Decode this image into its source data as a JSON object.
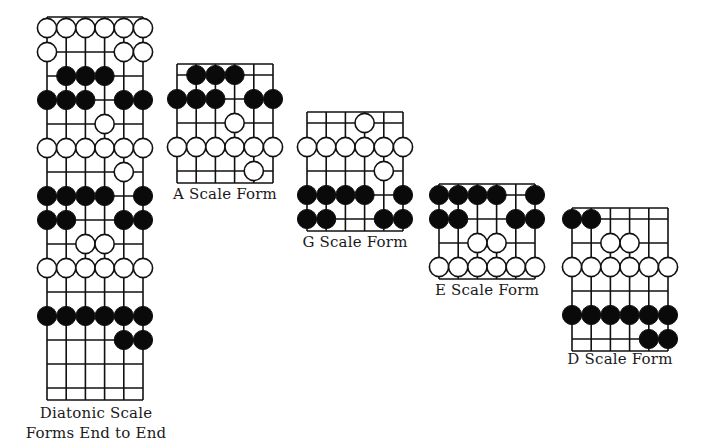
{
  "diagrams": [
    {
      "id": "end-to-end",
      "label_lines": [
        "Diatonic Scale",
        "Forms End to End"
      ],
      "origin": [
        47,
        17
      ],
      "strings": 6,
      "string_spacing": 19.2,
      "first_row_y": 11,
      "row_spacing": 24,
      "rows": 16,
      "bottom": 383,
      "dots": [
        {
          "row": 0,
          "open": [
            1,
            2,
            3,
            4,
            5,
            6
          ],
          "filled": []
        },
        {
          "row": 1,
          "open": [
            1,
            5,
            6
          ],
          "filled": []
        },
        {
          "row": 2,
          "open": [],
          "filled": [
            2,
            3,
            4
          ]
        },
        {
          "row": 3,
          "open": [],
          "filled": [
            1,
            2,
            3,
            5,
            6
          ]
        },
        {
          "row": 4,
          "open": [
            4
          ],
          "filled": []
        },
        {
          "row": 5,
          "open": [
            1,
            2,
            3,
            4,
            5,
            6
          ],
          "filled": []
        },
        {
          "row": 6,
          "open": [
            5
          ],
          "filled": []
        },
        {
          "row": 7,
          "open": [],
          "filled": [
            1,
            2,
            3,
            4,
            6
          ]
        },
        {
          "row": 8,
          "open": [],
          "filled": [
            1,
            2,
            5,
            6
          ]
        },
        {
          "row": 9,
          "open": [
            3,
            4
          ],
          "filled": []
        },
        {
          "row": 10,
          "open": [
            1,
            2,
            3,
            4,
            5,
            6
          ],
          "filled": []
        },
        {
          "row": 12,
          "open": [],
          "filled": [
            1,
            2,
            3,
            4,
            5,
            6
          ]
        },
        {
          "row": 13,
          "open": [],
          "filled": [
            5,
            6
          ]
        }
      ],
      "label_pos": [
        96,
        403
      ]
    },
    {
      "id": "a-scale-form",
      "label_lines": [
        "A Scale Form"
      ],
      "origin": [
        177,
        64
      ],
      "strings": 6,
      "string_spacing": 19.2,
      "first_row_y": 11,
      "row_spacing": 24,
      "rows": 5,
      "bottom": 119,
      "dots": [
        {
          "row": 0,
          "open": [],
          "filled": [
            2,
            3,
            4
          ]
        },
        {
          "row": 1,
          "open": [],
          "filled": [
            1,
            2,
            3,
            5,
            6
          ]
        },
        {
          "row": 2,
          "open": [
            4
          ],
          "filled": []
        },
        {
          "row": 3,
          "open": [
            1,
            2,
            3,
            4,
            5,
            6
          ],
          "filled": []
        },
        {
          "row": 4,
          "open": [
            5
          ],
          "filled": []
        }
      ],
      "label_pos": [
        225,
        185
      ]
    },
    {
      "id": "g-scale-form",
      "label_lines": [
        "G Scale Form"
      ],
      "origin": [
        307,
        112
      ],
      "strings": 6,
      "string_spacing": 19.2,
      "first_row_y": 11,
      "row_spacing": 24,
      "rows": 5,
      "bottom": 119,
      "dots": [
        {
          "row": 0,
          "open": [
            4
          ],
          "filled": []
        },
        {
          "row": 1,
          "open": [
            1,
            2,
            3,
            4,
            5,
            6
          ],
          "filled": []
        },
        {
          "row": 2,
          "open": [
            5
          ],
          "filled": []
        },
        {
          "row": 3,
          "open": [],
          "filled": [
            1,
            2,
            3,
            4,
            6
          ]
        },
        {
          "row": 4,
          "open": [],
          "filled": [
            1,
            2,
            5,
            6
          ]
        }
      ],
      "label_pos": [
        355,
        233
      ]
    },
    {
      "id": "e-scale-form",
      "label_lines": [
        "E Scale Form"
      ],
      "origin": [
        439,
        184
      ],
      "strings": 6,
      "string_spacing": 19.2,
      "first_row_y": 11,
      "row_spacing": 24,
      "rows": 4,
      "bottom": 95,
      "dots": [
        {
          "row": 0,
          "open": [],
          "filled": [
            1,
            2,
            3,
            4,
            6
          ]
        },
        {
          "row": 1,
          "open": [],
          "filled": [
            1,
            2,
            5,
            6
          ]
        },
        {
          "row": 2,
          "open": [
            3,
            4
          ],
          "filled": []
        },
        {
          "row": 3,
          "open": [
            1,
            2,
            3,
            4,
            5,
            6
          ],
          "filled": []
        }
      ],
      "label_pos": [
        487,
        281
      ]
    },
    {
      "id": "d-scale-form",
      "label_lines": [
        "D Scale Form"
      ],
      "origin": [
        572,
        208
      ],
      "strings": 6,
      "string_spacing": 19.2,
      "first_row_y": 11,
      "row_spacing": 24,
      "rows": 6,
      "bottom": 143,
      "dots": [
        {
          "row": 0,
          "open": [],
          "filled": [
            1,
            2
          ]
        },
        {
          "row": 1,
          "open": [
            3,
            4
          ],
          "filled": []
        },
        {
          "row": 2,
          "open": [
            1,
            2,
            3,
            4,
            5,
            6
          ],
          "filled": []
        },
        {
          "row": 4,
          "open": [],
          "filled": [
            1,
            2,
            3,
            4,
            5,
            6
          ]
        },
        {
          "row": 5,
          "open": [],
          "filled": [
            5,
            6
          ]
        }
      ],
      "label_pos": [
        620,
        350
      ]
    }
  ],
  "style": {
    "line_color": "#111111",
    "fill_color": "#0a0a0a",
    "open_fill": "#ffffff",
    "dot_radius": 9.6
  }
}
